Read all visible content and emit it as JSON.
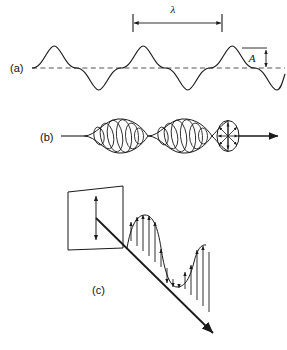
{
  "figure": {
    "title": "",
    "background_color": "#ffffff",
    "stroke_color": "#1a1a1a",
    "dashed_axis_color": "#555555"
  },
  "panels": [
    {
      "id": "a",
      "label": "(a)",
      "description": "transverse sine wave with wavelength and amplitude annotations",
      "annotations": {
        "wavelength_symbol": "λ",
        "amplitude_symbol": "A"
      },
      "wave": {
        "cycles": 3,
        "baseline_y": 68,
        "amplitude_px": 22,
        "wavelength_px": 89,
        "start_x": 32,
        "end_x": 285
      }
    },
    {
      "id": "b",
      "label": "(b)",
      "description": "unpolarized light beam shown as nested ellipses with radial double arrows",
      "annotations": {
        "ray_direction": "right"
      }
    },
    {
      "id": "c",
      "label": "(c)",
      "description": "plane polarized light: polarization plane with vertical double arrow and diagonal ray with vertical field vectors",
      "annotations": {
        "plane_arrow": "vertical double arrow",
        "ray_direction": "down-right"
      }
    }
  ],
  "labels": {
    "a": "(a)",
    "b": "(b)",
    "c": "(c)",
    "lambda": "λ",
    "amplitude": "A"
  }
}
